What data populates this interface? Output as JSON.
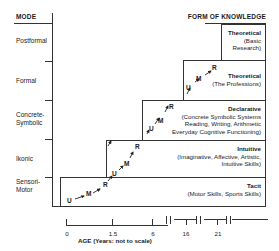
{
  "left_axis": {
    "header": "MODE",
    "modes": [
      {
        "label": "Postformal"
      },
      {
        "label": "Formal"
      },
      {
        "label": "Concrete-\nSymbolic",
        "line1": "Concrete-",
        "line2": "Symbolic"
      },
      {
        "label": "Ikonic"
      },
      {
        "label": "Sensori-\nMotor",
        "line1": "Sensori-",
        "line2": "Motor"
      }
    ]
  },
  "right_axis": {
    "header": "FORM OF KNOWLEDGE"
  },
  "knowledge_forms": [
    {
      "title": "Theoretical",
      "desc_lines": [
        "(Basic",
        "Research)"
      ]
    },
    {
      "title": "Theoretical",
      "desc_lines": [
        "(The Professions)"
      ]
    },
    {
      "title": "Declarative",
      "desc_lines": [
        "(Concrete Symbolic Systems",
        "Reading, Writing, Arithmetic",
        "Everyday Cognitive Functioning)"
      ]
    },
    {
      "title": "Intuitive",
      "desc_lines": [
        "(Imaginative, Affective, Artistic,",
        "Intuitive Skills)"
      ]
    },
    {
      "title": "Tacit",
      "desc_lines": [
        "(Motor Skills, Sports Skills)"
      ]
    }
  ],
  "stage_markers": {
    "U": "U",
    "M": "M",
    "R": "R"
  },
  "x_axis": {
    "title": "AGE (Years: not to scale)",
    "ticks": [
      "0",
      "1.5",
      "6",
      "16",
      "21"
    ]
  }
}
